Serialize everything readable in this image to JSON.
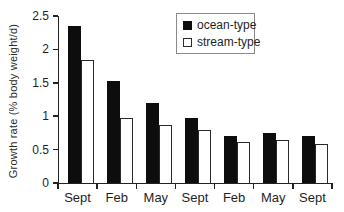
{
  "chart_data": {
    "type": "bar",
    "title": "",
    "xlabel": "",
    "ylabel": "Growth rate (% body weight/d)",
    "categories": [
      "Sept",
      "Feb",
      "May",
      "Sept",
      "Feb",
      "May",
      "Sept"
    ],
    "series": [
      {
        "name": "ocean-type",
        "swatch": "black-filled-square",
        "color": "#0d0d0d",
        "values": [
          2.35,
          1.52,
          1.2,
          0.97,
          0.71,
          0.75,
          0.7
        ]
      },
      {
        "name": "stream-type",
        "swatch": "white-outlined-square",
        "color": "#ffffff",
        "values": [
          1.84,
          0.97,
          0.87,
          0.79,
          0.62,
          0.64,
          0.58
        ]
      }
    ],
    "ylim": [
      0,
      2.5
    ],
    "yticks": [
      0,
      0.5,
      1,
      1.5,
      2,
      2.5
    ],
    "ytick_labels": [
      "0",
      "0.5",
      "1",
      "1.5",
      "2",
      "2.5"
    ],
    "grid": false,
    "legend_position": "top-right",
    "colors": {
      "bar_fill": "#0d0d0d",
      "axis": "#222222",
      "legend_border": "#8a8a8a",
      "text": "#1f1f1f"
    }
  }
}
